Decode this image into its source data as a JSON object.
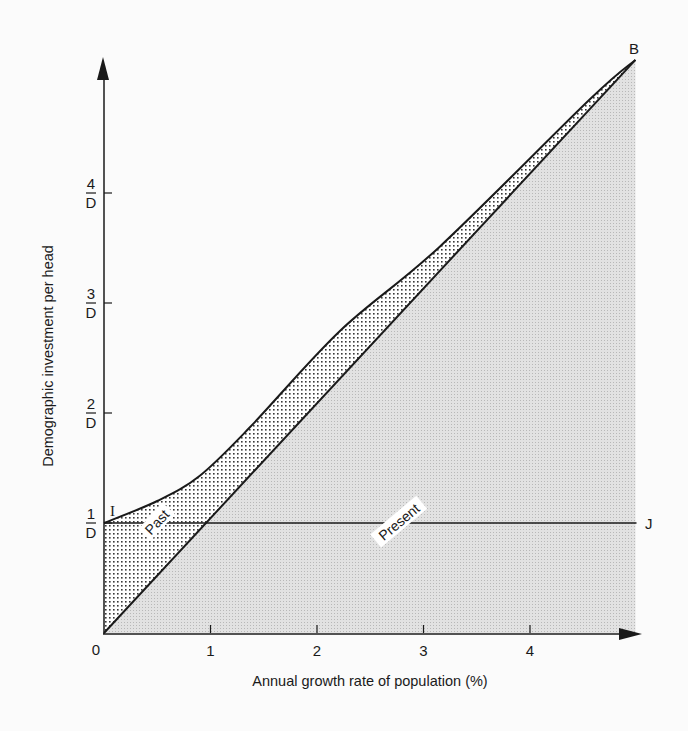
{
  "chart_data": {
    "type": "area",
    "title": "",
    "xlabel": "Annual growth rate of population (%)",
    "ylabel": "Demographic investment per head",
    "xlim": [
      0,
      5
    ],
    "ylim": [
      0,
      5.3
    ],
    "x_ticks": [
      {
        "value": 0,
        "label": "0"
      },
      {
        "value": 1,
        "label": "1"
      },
      {
        "value": 2,
        "label": "2"
      },
      {
        "value": 3,
        "label": "3"
      },
      {
        "value": 4,
        "label": "4"
      }
    ],
    "y_ticks": [
      {
        "value": 1,
        "numerator": "1",
        "denominator": "D"
      },
      {
        "value": 2,
        "numerator": "2",
        "denominator": "D"
      },
      {
        "value": 3,
        "numerator": "3",
        "denominator": "D"
      },
      {
        "value": 4,
        "numerator": "4",
        "denominator": "D"
      }
    ],
    "series": [
      {
        "name": "Diagonal 0B",
        "points": [
          [
            0,
            0
          ],
          [
            4.99,
            5.21
          ]
        ]
      },
      {
        "name": "Upper curve IB",
        "points": [
          [
            0,
            1.0
          ],
          [
            0.5,
            1.2
          ],
          [
            0.9,
            1.43
          ],
          [
            1.37,
            1.87
          ],
          [
            2.22,
            2.75
          ],
          [
            3.15,
            3.51
          ],
          [
            4.56,
            4.85
          ],
          [
            4.99,
            5.21
          ]
        ]
      },
      {
        "name": "Horizontal IJ",
        "points": [
          [
            0,
            1.0
          ],
          [
            5.0,
            1.0
          ]
        ]
      }
    ],
    "regions": [
      {
        "name": "Past",
        "fill": "coarse dot stipple",
        "bounded_by": "y-axis, upper curve IB, diagonal 0B"
      },
      {
        "name": "Present",
        "fill": "fine light gray stipple",
        "bounded_by": "x-axis, diagonal 0B, x=5"
      }
    ],
    "annotations": [
      {
        "text": "I",
        "x": 0,
        "y": 1.0
      },
      {
        "text": "J",
        "x": 5.0,
        "y": 1.0
      },
      {
        "text": "B",
        "x": 4.99,
        "y": 5.21
      },
      {
        "text": "Past",
        "x": 0.5,
        "y": 1.0,
        "rotation": -47
      },
      {
        "text": "Present",
        "x": 2.75,
        "y": 1.0,
        "rotation": -40
      }
    ],
    "grid": false,
    "legend": "none"
  },
  "labels": {
    "x_axis_title": "Annual growth rate of population (%)",
    "y_axis_title": "Demographic investment per head",
    "origin": "0",
    "point_I": "I",
    "point_J": "J",
    "point_B": "B",
    "region_past": "Past",
    "region_present": "Present"
  },
  "colors": {
    "ink": "#1a1a1a",
    "present_fill": "#d9d9d9",
    "past_dots": "#3a3a3a",
    "background": "#fbfbfb"
  }
}
